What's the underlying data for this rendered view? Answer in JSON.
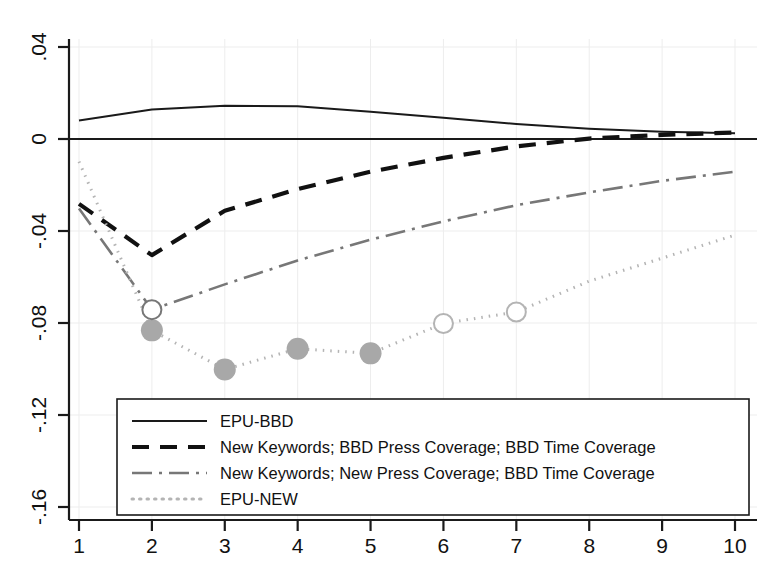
{
  "chart_data": {
    "type": "line",
    "title": "",
    "subtitle": "",
    "xlabel": "",
    "ylabel": "",
    "x": [
      1,
      2,
      3,
      4,
      5,
      6,
      7,
      8,
      9,
      10
    ],
    "xlim": [
      1,
      10
    ],
    "ylim": [
      -0.16,
      0.04
    ],
    "xticks": [
      "1",
      "2",
      "3",
      "4",
      "5",
      "6",
      "7",
      "8",
      "9",
      "10"
    ],
    "yticks": [
      ".04",
      "0",
      "-.04",
      "-.08",
      "-.12",
      "-.16"
    ],
    "ytick_values": [
      0.04,
      0,
      -0.04,
      -0.08,
      -0.12,
      -0.16
    ],
    "grid": true,
    "zero_line": true,
    "legend_position": "bottom-left-inside",
    "series": [
      {
        "name": "EPU-BBD",
        "style": "solid",
        "color": "#1a1a1a",
        "width": 2.0,
        "markers": "none",
        "values": [
          0.008,
          0.0128,
          0.0145,
          0.0142,
          0.0118,
          0.0092,
          0.0065,
          0.0045,
          0.0032,
          0.0025
        ]
      },
      {
        "name": "New Keywords; BBD Press Coverage; BBD Time Coverage",
        "style": "dashed",
        "color": "#111111",
        "width": 4.2,
        "markers": "none",
        "values": [
          -0.0282,
          -0.0505,
          -0.0312,
          -0.0218,
          -0.0142,
          -0.0082,
          -0.0032,
          0.0002,
          0.0018,
          0.0028
        ]
      },
      {
        "name": "New Keywords; New Press Coverage; BBD Time Coverage",
        "style": "dash-dot",
        "color": "#777777",
        "width": 2.6,
        "markers": "none",
        "values": [
          -0.0302,
          -0.0742,
          -0.0632,
          -0.0528,
          -0.0438,
          -0.0358,
          -0.0288,
          -0.0232,
          -0.0182,
          -0.0142
        ]
      },
      {
        "name": "EPU-NEW",
        "style": "dotted",
        "color": "#b4b4b4",
        "width": 3.0,
        "markers": "circle",
        "values": [
          -0.0098,
          -0.0832,
          -0.1002,
          -0.0912,
          -0.0932,
          -0.0802,
          -0.0752,
          -0.0618,
          -0.0518,
          -0.0418
        ],
        "marker_points": [
          {
            "x": 2,
            "y": -0.0832,
            "filled": true
          },
          {
            "x": 3,
            "y": -0.1002,
            "filled": true
          },
          {
            "x": 4,
            "y": -0.0912,
            "filled": true
          },
          {
            "x": 5,
            "y": -0.0932,
            "filled": true
          },
          {
            "x": 6,
            "y": -0.0802,
            "filled": false
          },
          {
            "x": 7,
            "y": -0.0752,
            "filled": false
          }
        ]
      }
    ],
    "extra_markers": [
      {
        "series": "New Keywords; New Press Coverage; BBD Time Coverage",
        "x": 2,
        "y": -0.0742,
        "filled": false,
        "color": "#777777"
      }
    ]
  },
  "legend": {
    "entries": [
      {
        "label": "EPU-BBD",
        "style": "solid"
      },
      {
        "label": "New Keywords; BBD Press Coverage; BBD Time Coverage",
        "style": "dashed"
      },
      {
        "label": "New Keywords; New Press Coverage; BBD Time Coverage",
        "style": "dash-dot"
      },
      {
        "label": "EPU-NEW",
        "style": "dotted"
      }
    ]
  },
  "colors": {
    "background": "#ffffff",
    "axis": "#1a1a1a",
    "grid": "#ededed",
    "series_solid": "#1a1a1a",
    "series_dashed": "#111111",
    "series_dashdot": "#777777",
    "series_dotted": "#b4b4b4",
    "marker_fill": "#a8a8a8"
  }
}
